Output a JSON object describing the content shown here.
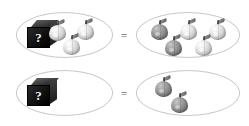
{
  "figure": {
    "equals_symbol": "="
  },
  "rows": [
    {
      "id": "equation-1",
      "left_set": {
        "box": {
          "present": true,
          "label": "?"
        },
        "apples": [
          {
            "shade": "light",
            "x": 45,
            "y": 13
          },
          {
            "shade": "light",
            "x": 73,
            "y": 12
          },
          {
            "shade": "light",
            "x": 59,
            "y": 27
          }
        ],
        "apple_count": 3,
        "light_count": 3,
        "dark_count": 0
      },
      "right_set": {
        "box": {
          "present": false,
          "label": ""
        },
        "apples": [
          {
            "shade": "dark",
            "x": 148,
            "y": 11
          },
          {
            "shade": "light",
            "x": 178,
            "y": 11
          },
          {
            "shade": "light",
            "x": 207,
            "y": 11
          },
          {
            "shade": "dark",
            "x": 162,
            "y": 27
          },
          {
            "shade": "light",
            "x": 192,
            "y": 27
          }
        ],
        "apple_count": 5,
        "light_count": 3,
        "dark_count": 2
      }
    },
    {
      "id": "equation-2",
      "left_set": {
        "box": {
          "present": true,
          "label": "?"
        },
        "apples": [],
        "apple_count": 0,
        "light_count": 0,
        "dark_count": 0
      },
      "right_set": {
        "box": {
          "present": false,
          "label": ""
        },
        "apples": [
          {
            "shade": "dark",
            "x": 152,
            "y": 10
          },
          {
            "shade": "dark",
            "x": 168,
            "y": 26
          }
        ],
        "apple_count": 2,
        "light_count": 0,
        "dark_count": 2
      }
    }
  ],
  "colors": {
    "ellipse_outline": "#c9c9c9",
    "box_front": "#111111",
    "box_question_mark": "#f2f2f2",
    "apple_light": "#d6d6d6",
    "apple_dark": "#8d8d8d",
    "equals_sign": "#6b6b6b",
    "background": "#ffffff"
  }
}
